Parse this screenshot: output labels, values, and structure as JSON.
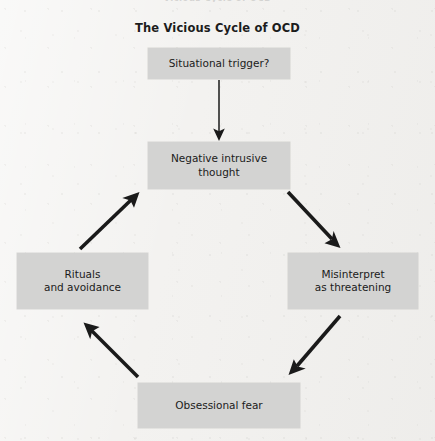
{
  "page": {
    "width": 435,
    "height": 441,
    "background_color": "#f3f2f0",
    "node_fill_color": "#d3d3d2",
    "text_color": "#1b1b1b",
    "arrow_color": "#1a1a1a",
    "clipped_header_text": "Vicious Cycle of OCD"
  },
  "diagram": {
    "type": "cycle-flowchart",
    "title": "The Vicious Cycle of OCD",
    "nodes": [
      {
        "id": "trigger",
        "label": "Situational trigger?",
        "lines": [
          "Situational trigger?"
        ]
      },
      {
        "id": "thought",
        "label": "Negative intrusive thought",
        "lines": [
          "Negative intrusive",
          "thought"
        ]
      },
      {
        "id": "misinterp",
        "label": "Misinterpret as threatening",
        "lines": [
          "Misinterpret",
          "as threatening"
        ]
      },
      {
        "id": "fear",
        "label": "Obsessional fear",
        "lines": [
          "Obsessional fear"
        ]
      },
      {
        "id": "rituals",
        "label": "Rituals and avoidance",
        "lines": [
          "Rituals",
          "and avoidance"
        ]
      }
    ],
    "edges": [
      {
        "from": "trigger",
        "to": "thought",
        "style": "thin",
        "direction": "down"
      },
      {
        "from": "thought",
        "to": "misinterp",
        "style": "thick",
        "direction": "down-right"
      },
      {
        "from": "misinterp",
        "to": "fear",
        "style": "thick",
        "direction": "down-left"
      },
      {
        "from": "fear",
        "to": "rituals",
        "style": "thick",
        "direction": "up-left"
      },
      {
        "from": "rituals",
        "to": "thought",
        "style": "thick",
        "direction": "up-right"
      }
    ]
  }
}
